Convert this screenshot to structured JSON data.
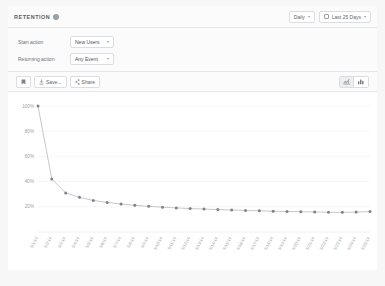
{
  "header": {
    "title": "RETENTION",
    "help_icon": "question-circle-icon",
    "interval": {
      "label": "Daily",
      "chevron": "▾"
    },
    "date_range": {
      "label": "Last 25 Days",
      "icon": "calendar-icon",
      "chevron": "▾"
    }
  },
  "filters": {
    "start": {
      "label": "Start action",
      "value": "New Users",
      "chevron": "▾"
    },
    "returning": {
      "label": "Returning action",
      "value": "Any Event",
      "chevron": "▾"
    }
  },
  "toolbar": {
    "bookmark_label": "⚑",
    "bookmark_icon": "bookmark-icon",
    "save_label": "Save...",
    "save_icon": "download-icon",
    "share_label": "Share",
    "share_icon": "share-icon",
    "chart_toggle": {
      "line_icon": "line-chart-icon",
      "bar_icon": "bar-chart-icon",
      "selected": "line"
    }
  },
  "chart_data": {
    "type": "line",
    "title": "",
    "xlabel": "",
    "ylabel": "",
    "ylim": [
      0,
      100
    ],
    "grid": true,
    "legend": false,
    "yticks": [
      100,
      80,
      60,
      40,
      20
    ],
    "ytick_labels": [
      "100%",
      "80%",
      "60%",
      "40%",
      "20%"
    ],
    "line_color": "#b6b9bd",
    "marker_color": "#7e838a",
    "categories": [
      "5/1/14",
      "5/2/14",
      "5/3/14",
      "5/4/14",
      "5/5/14",
      "5/6/14",
      "5/7/14",
      "5/8/14",
      "5/9/14",
      "5/10/14",
      "5/11/14",
      "5/12/14",
      "5/13/14",
      "5/14/14",
      "5/15/14",
      "5/16/14",
      "5/17/14",
      "5/18/14",
      "5/19/14",
      "5/20/14",
      "5/21/14",
      "5/22/14",
      "5/23/14",
      "5/24/14",
      "5/25/14"
    ],
    "values": [
      100,
      42,
      31,
      27.5,
      25,
      23.5,
      22.2,
      21.2,
      20.4,
      19.7,
      19.1,
      18.6,
      18.2,
      17.8,
      17.4,
      17.1,
      16.8,
      16.5,
      16.3,
      16.1,
      15.9,
      15.7,
      15.6,
      15.8,
      16.2
    ]
  }
}
